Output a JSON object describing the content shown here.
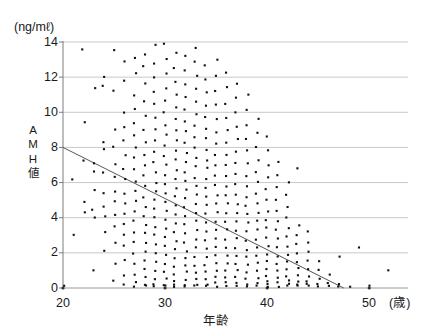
{
  "chart_data": {
    "type": "scatter",
    "title": "",
    "subtitle": "",
    "xlabel": "年齢",
    "ylabel": "AMH値",
    "y_unit_label": "(ng/mℓ)",
    "x_unit_label": "(歳)",
    "xlim": [
      20,
      52
    ],
    "ylim": [
      0,
      14
    ],
    "xticks": [
      20,
      30,
      40,
      50
    ],
    "yticks": [
      0,
      2,
      4,
      6,
      8,
      10,
      12,
      14
    ],
    "grid": "horizontal",
    "legend": "none",
    "marker": "small-dot",
    "marker_color": "#111111",
    "gridline_color": "#c9c9c9",
    "axis_color": "#9a9a9a",
    "trendline": {
      "label": "regression line",
      "color": "#555555",
      "x_start": 20,
      "y_start": 8.0,
      "x_end": 47.5,
      "y_end": 0.0
    },
    "y_axis_title_chars": [
      "A",
      "M",
      "H",
      "値"
    ],
    "series": [
      {
        "name": "AMH by age",
        "points_by_age": [
          {
            "age": 20,
            "values": [
              0.1
            ]
          },
          {
            "age": 21,
            "values": [
              6.2,
              3.0
            ]
          },
          {
            "age": 22,
            "values": [
              13.6,
              9.4,
              7.3,
              4.9,
              4.3
            ]
          },
          {
            "age": 23,
            "values": [
              11.4,
              7.1,
              6.6,
              5.6,
              4.5,
              4.0,
              1.0
            ]
          },
          {
            "age": 24,
            "values": [
              12.0,
              11.5,
              8.3,
              7.9,
              6.6,
              5.4,
              4.6,
              4.1,
              3.2,
              2.1
            ]
          },
          {
            "age": 25,
            "values": [
              13.5,
              11.2,
              9.0,
              8.0,
              7.0,
              6.3,
              5.5,
              4.9,
              4.2,
              3.5,
              2.6,
              1.4,
              0.4
            ]
          },
          {
            "age": 26,
            "values": [
              12.9,
              11.8,
              10.0,
              9.2,
              8.4,
              7.6,
              6.8,
              6.2,
              5.4,
              4.8,
              4.2,
              3.6,
              3.0,
              2.4,
              1.6,
              0.7,
              0.2
            ]
          },
          {
            "age": 27,
            "values": [
              13.1,
              12.2,
              11.0,
              10.2,
              9.4,
              8.7,
              8.0,
              7.4,
              6.8,
              6.1,
              5.5,
              5.0,
              4.4,
              3.8,
              3.2,
              2.6,
              2.0,
              1.4,
              0.8,
              0.3,
              0.1
            ]
          },
          {
            "age": 28,
            "values": [
              13.3,
              12.6,
              11.6,
              10.6,
              9.8,
              9.0,
              8.3,
              7.6,
              7.0,
              6.4,
              5.8,
              5.2,
              4.6,
              4.1,
              3.6,
              3.1,
              2.6,
              2.1,
              1.6,
              1.1,
              0.6,
              0.2,
              0.1
            ]
          },
          {
            "age": 29,
            "values": [
              13.8,
              12.8,
              12.0,
              11.2,
              10.5,
              9.7,
              9.0,
              8.4,
              7.8,
              7.2,
              6.6,
              6.0,
              5.5,
              5.0,
              4.5,
              4.0,
              3.5,
              3.0,
              2.5,
              2.0,
              1.5,
              1.0,
              0.5,
              0.2,
              0.1
            ]
          },
          {
            "age": 30,
            "values": [
              13.9,
              13.0,
              12.2,
              11.4,
              10.7,
              10.0,
              9.3,
              8.7,
              8.1,
              7.5,
              7.0,
              6.4,
              5.9,
              5.4,
              4.9,
              4.4,
              3.9,
              3.4,
              2.9,
              2.4,
              1.9,
              1.4,
              0.9,
              0.5,
              0.2,
              0.1
            ]
          },
          {
            "age": 31,
            "values": [
              13.4,
              12.5,
              11.7,
              11.0,
              10.3,
              9.6,
              9.0,
              8.4,
              7.8,
              7.3,
              6.7,
              6.2,
              5.7,
              5.2,
              4.7,
              4.2,
              3.7,
              3.2,
              2.7,
              2.2,
              1.7,
              1.2,
              0.8,
              0.4,
              0.2,
              0.1
            ]
          },
          {
            "age": 32,
            "values": [
              13.2,
              12.4,
              11.6,
              10.9,
              10.2,
              9.5,
              8.9,
              8.3,
              7.7,
              7.2,
              6.6,
              6.1,
              5.6,
              5.1,
              4.6,
              4.1,
              3.6,
              3.1,
              2.6,
              2.1,
              1.7,
              1.3,
              0.9,
              0.5,
              0.2,
              0.1
            ]
          },
          {
            "age": 33,
            "values": [
              13.7,
              12.9,
              12.1,
              11.3,
              10.6,
              9.9,
              9.2,
              8.6,
              8.0,
              7.4,
              6.9,
              6.3,
              5.8,
              5.3,
              4.8,
              4.3,
              3.8,
              3.3,
              2.8,
              2.3,
              1.8,
              1.3,
              0.9,
              0.5,
              0.2,
              0.1
            ]
          },
          {
            "age": 34,
            "values": [
              12.7,
              11.9,
              11.1,
              10.4,
              9.7,
              9.1,
              8.5,
              7.9,
              7.3,
              6.8,
              6.2,
              5.7,
              5.2,
              4.7,
              4.2,
              3.7,
              3.2,
              2.7,
              2.2,
              1.8,
              1.3,
              0.9,
              0.5,
              0.2,
              0.1
            ]
          },
          {
            "age": 35,
            "values": [
              13.0,
              12.1,
              11.2,
              10.4,
              9.6,
              8.9,
              8.2,
              7.6,
              7.0,
              6.4,
              5.9,
              5.3,
              4.8,
              4.3,
              3.8,
              3.3,
              2.8,
              2.3,
              1.9,
              1.4,
              1.0,
              0.6,
              0.3,
              0.1
            ]
          },
          {
            "age": 36,
            "values": [
              12.3,
              11.4,
              10.5,
              9.7,
              9.0,
              8.3,
              7.6,
              7.0,
              6.4,
              5.8,
              5.3,
              4.8,
              4.3,
              3.8,
              3.3,
              2.8,
              2.3,
              1.8,
              1.4,
              1.0,
              0.6,
              0.3,
              0.1
            ]
          },
          {
            "age": 37,
            "values": [
              11.6,
              10.8,
              10.0,
              9.2,
              8.5,
              7.8,
              7.1,
              6.5,
              5.9,
              5.3,
              4.8,
              4.3,
              3.8,
              3.3,
              2.8,
              2.3,
              1.8,
              1.4,
              1.0,
              0.6,
              0.3,
              0.1
            ]
          },
          {
            "age": 38,
            "values": [
              11.0,
              10.1,
              9.3,
              8.5,
              7.8,
              7.1,
              6.4,
              5.8,
              5.2,
              4.7,
              4.2,
              3.7,
              3.2,
              2.7,
              2.2,
              1.8,
              1.3,
              0.9,
              0.5,
              0.2,
              0.1
            ]
          },
          {
            "age": 39,
            "values": [
              9.6,
              8.8,
              8.0,
              7.3,
              6.6,
              6.0,
              5.4,
              4.8,
              4.3,
              3.8,
              3.3,
              2.8,
              2.3,
              1.8,
              1.4,
              1.0,
              0.6,
              0.3,
              0.1
            ]
          },
          {
            "age": 40,
            "values": [
              8.6,
              7.8,
              7.0,
              6.3,
              5.6,
              5.0,
              4.4,
              3.9,
              3.4,
              2.9,
              2.4,
              1.9,
              1.5,
              1.1,
              0.7,
              0.4,
              0.2,
              0.1
            ]
          },
          {
            "age": 41,
            "values": [
              7.2,
              6.4,
              5.7,
              5.0,
              4.4,
              3.8,
              3.3,
              2.8,
              2.3,
              1.8,
              1.4,
              1.0,
              0.6,
              0.3,
              0.1
            ]
          },
          {
            "age": 42,
            "values": [
              6.0,
              5.3,
              4.6,
              4.0,
              3.4,
              2.9,
              2.4,
              1.9,
              1.5,
              1.1,
              0.7,
              0.4,
              0.2,
              0.1
            ]
          },
          {
            "age": 43,
            "values": [
              6.8,
              3.6,
              3.0,
              2.5,
              2.0,
              1.5,
              1.1,
              0.7,
              0.4,
              0.2,
              0.1
            ]
          },
          {
            "age": 44,
            "values": [
              3.2,
              2.6,
              2.1,
              1.6,
              1.1,
              0.7,
              0.4,
              0.2,
              0.1
            ]
          },
          {
            "age": 45,
            "values": [
              1.5,
              1.0,
              0.5,
              0.2,
              0.1
            ]
          },
          {
            "age": 46,
            "values": [
              0.8,
              0.3,
              0.1
            ]
          },
          {
            "age": 47,
            "values": [
              1.8,
              0.2,
              0.1
            ]
          },
          {
            "age": 48,
            "values": [
              0.1
            ]
          },
          {
            "age": 49,
            "values": [
              2.3
            ]
          },
          {
            "age": 50,
            "values": [
              0.1
            ]
          },
          {
            "age": 52,
            "values": [
              1.0
            ]
          }
        ]
      }
    ]
  }
}
